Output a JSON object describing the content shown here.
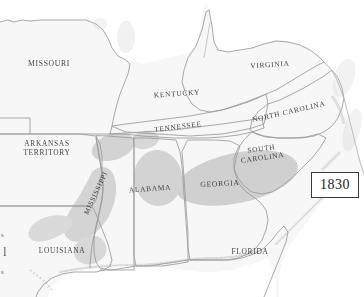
{
  "map": {
    "title": "Cotton Producing Regions of the Southern United States",
    "year_box": {
      "label": "1830"
    },
    "colors": {
      "land_fill": "#f7f7f7",
      "land_fill_alt": "#f2f2f2",
      "border_stroke": "#9a9a9a",
      "coast_stroke": "#b4b4b4",
      "shaded_region": "#c9c9c9",
      "shaded_region_light": "#d8d8d8",
      "label_text": "#2b2b2b",
      "year_box_border": "#3a3a3a",
      "background": "#ffffff",
      "water": "#ffffff"
    },
    "states": [
      {
        "id": "missouri",
        "name": "MISSOURI",
        "x": 49,
        "y": 68,
        "rotate": 0,
        "size": 7.6,
        "lines": [
          "MISSOURI"
        ]
      },
      {
        "id": "arkansas",
        "name": "ARKANSAS TERRITORY",
        "x": 47,
        "y": 152,
        "rotate": 0,
        "size": 7.4,
        "lines": [
          "ARKANSAS",
          "TERRITORY"
        ]
      },
      {
        "id": "louisiana",
        "name": "LOUISIANA",
        "x": 62,
        "y": 253,
        "rotate": 0,
        "size": 7.4,
        "lines": [
          "LOUISIANA"
        ]
      },
      {
        "id": "mississippi",
        "name": "MISSISSIPPI",
        "x": 96,
        "y": 193,
        "rotate": -65,
        "size": 7.0,
        "lines": [
          "MISSISSIPPI"
        ]
      },
      {
        "id": "alabama",
        "name": "ALABAMA",
        "x": 150,
        "y": 190,
        "rotate": -4,
        "size": 7.4,
        "lines": [
          "ALABAMA"
        ]
      },
      {
        "id": "tennessee",
        "name": "TENNESSEE",
        "x": 178,
        "y": 128,
        "rotate": -7,
        "size": 7.4,
        "lines": [
          "TENNESSEE"
        ]
      },
      {
        "id": "kentucky",
        "name": "KENTUCKY",
        "x": 177,
        "y": 95,
        "rotate": -4,
        "size": 7.4,
        "lines": [
          "KENTUCKY"
        ]
      },
      {
        "id": "virginia",
        "name": "VIRGINIA",
        "x": 270,
        "y": 66,
        "rotate": -4,
        "size": 7.4,
        "lines": [
          "VIRGINIA"
        ]
      },
      {
        "id": "north-carolina",
        "name": "NORTH CAROLINA",
        "x": 289,
        "y": 113,
        "rotate": -13,
        "size": 7.4,
        "lines": [
          "NORTH CAROLINA"
        ]
      },
      {
        "id": "south-carolina",
        "name": "SOUTH CAROLINA",
        "x": 262,
        "y": 155,
        "rotate": -8,
        "size": 7.4,
        "lines": [
          "SOUTH",
          "CAROLINA"
        ]
      },
      {
        "id": "georgia",
        "name": "GEORGIA",
        "x": 220,
        "y": 185,
        "rotate": -3,
        "size": 7.6,
        "lines": [
          "GEORGIA"
        ]
      },
      {
        "id": "florida",
        "name": "FLORIDA",
        "x": 250,
        "y": 253,
        "rotate": 0,
        "size": 7.4,
        "lines": [
          "FLORIDA"
        ]
      }
    ],
    "edge_fragments": [
      {
        "id": "frag-top",
        "text": "s",
        "x": 1,
        "y": 235,
        "size": 7
      },
      {
        "id": "frag-middle",
        "text": "l",
        "x": 2,
        "y": 252,
        "size": 12
      },
      {
        "id": "frag-bottom",
        "text": "s",
        "x": 1,
        "y": 272,
        "size": 7
      }
    ]
  }
}
